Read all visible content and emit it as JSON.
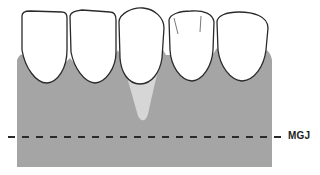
{
  "diagram": {
    "labels": {
      "mgj": "MGJ"
    },
    "colors": {
      "gingiva": "#a5a5a5",
      "recession": "#d6d6d6",
      "tooth_fill": "#ffffff",
      "tooth_outline": "#2a2a2a",
      "mgj_line": "#2a2a2a"
    },
    "teeth_count": 5
  }
}
